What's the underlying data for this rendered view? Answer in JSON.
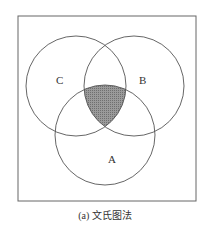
{
  "diagram": {
    "type": "venn",
    "sets": [
      {
        "label": "A",
        "cx": 105,
        "cy": 135,
        "r": 50
      },
      {
        "label": "B",
        "cx": 134,
        "cy": 86,
        "r": 50
      },
      {
        "label": "C",
        "cx": 76,
        "cy": 86,
        "r": 50
      }
    ],
    "shaded_region": "A ∩ B ∩ C",
    "shade_color": "#8a8a8a",
    "line_color": "#555555"
  },
  "labels": {
    "a": "A",
    "b": "B",
    "c": "C"
  },
  "caption": "(a) 文氏图法"
}
